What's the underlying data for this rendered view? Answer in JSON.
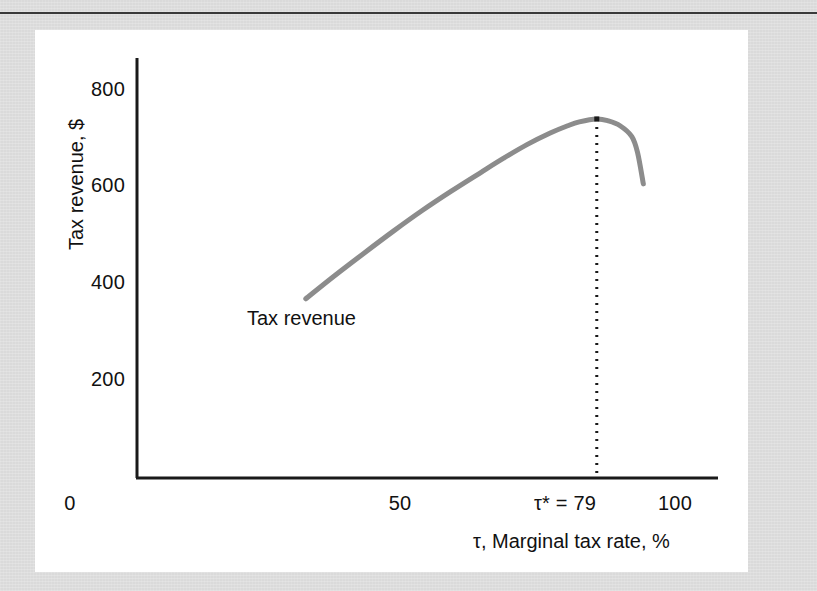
{
  "figure": {
    "panel_background": "#ffffff",
    "page_background": "#dadada",
    "rule_color": "#3a3a3a"
  },
  "chart_data": {
    "type": "line",
    "title": "",
    "subtitle": "",
    "xlabel": "τ, Marginal tax rate, %",
    "ylabel": "Tax revenue, $",
    "xlim": [
      0,
      110
    ],
    "ylim": [
      0,
      880
    ],
    "grid": false,
    "legend_position": "none",
    "axis_color": "#1a1a1a",
    "xticks": [
      {
        "value": 0,
        "label": "0"
      },
      {
        "value": 50,
        "label": "50"
      },
      {
        "value": 79,
        "label": "τ* = 79"
      },
      {
        "value": 100,
        "label": "100"
      }
    ],
    "yticks": [
      {
        "value": 200,
        "label": "200"
      },
      {
        "value": 400,
        "label": "400"
      },
      {
        "value": 600,
        "label": "600"
      },
      {
        "value": 800,
        "label": "800"
      }
    ],
    "series": [
      {
        "name": "Tax revenue",
        "color": "#8c8c8c",
        "width": 5,
        "x": [
          29,
          34,
          39,
          44,
          49,
          54,
          59,
          63,
          67,
          71,
          74,
          76,
          79,
          81,
          83,
          85,
          86,
          87
        ],
        "y": [
          370,
          418,
          464,
          509,
          552,
          592,
          630,
          660,
          688,
          712,
          727,
          735,
          741,
          737,
          727,
          705,
          672,
          607
        ]
      }
    ],
    "annotations": [
      {
        "name": "series-label",
        "text": "Tax revenue",
        "x": 29.5,
        "y": 305
      },
      {
        "name": "optimum-marker",
        "type": "point",
        "x": 79,
        "y": 741
      },
      {
        "name": "optimum-dropline",
        "type": "dotted-vertical",
        "x": 79,
        "y_from": 741,
        "y_to": 0,
        "color": "#1a1a1a"
      }
    ]
  }
}
